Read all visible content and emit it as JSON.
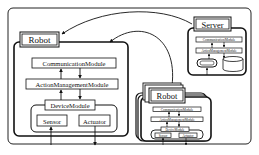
{
  "diagram": {
    "left_robot": {
      "title": "Robot",
      "modules": {
        "communication": "CommunicationModule",
        "action_management": "ActionManagementModule",
        "device": "DeviceModule",
        "sensor": "Sensor",
        "actuator": "Actuator"
      }
    },
    "server": {
      "title": "Server",
      "modules": {
        "communication": "CommunicationModule",
        "action_management": "ActionManagementModule",
        "pill": "",
        "database": ""
      }
    },
    "stacked_robots": {
      "title": "Robot",
      "modules": {
        "communication": "CommunicationModule",
        "action_management": "ActionManagementModule",
        "device": "DeviceModule",
        "sensor": "Sensor",
        "actuator": "Actuator"
      }
    },
    "caption": ""
  }
}
